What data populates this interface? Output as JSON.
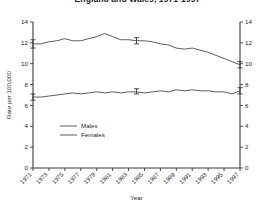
{
  "chart_data": {
    "type": "line",
    "title": "England and Wales, 1971-1997",
    "xlabel": "Year",
    "ylabel": "Rate per 100,000",
    "xlim": [
      1971,
      1997
    ],
    "ylim": [
      0,
      14
    ],
    "yticks": [
      0,
      2,
      4,
      6,
      8,
      10,
      12,
      14
    ],
    "dual_y_axis": true,
    "grid": false,
    "legend_position": "center-left",
    "xticks": [
      1971,
      1973,
      1975,
      1977,
      1979,
      1981,
      1983,
      1985,
      1987,
      1989,
      1991,
      1993,
      1995,
      1997
    ],
    "x": [
      1971,
      1972,
      1973,
      1974,
      1975,
      1976,
      1977,
      1978,
      1979,
      1980,
      1981,
      1982,
      1983,
      1984,
      1985,
      1986,
      1987,
      1988,
      1989,
      1990,
      1991,
      1992,
      1993,
      1994,
      1995,
      1996,
      1997
    ],
    "series": [
      {
        "name": "Males",
        "values": [
          11.9,
          11.9,
          12.1,
          12.2,
          12.4,
          12.2,
          12.2,
          12.4,
          12.6,
          12.9,
          12.6,
          12.3,
          12.3,
          12.2,
          12.2,
          12.1,
          11.9,
          11.8,
          11.5,
          11.4,
          11.5,
          11.3,
          11.1,
          10.8,
          10.5,
          10.2,
          9.9
        ],
        "error_bars": [
          {
            "year": 1971,
            "value": 11.9,
            "low": 11.5,
            "high": 12.3
          },
          {
            "year": 1984,
            "value": 12.2,
            "low": 11.9,
            "high": 12.5
          },
          {
            "year": 1997,
            "value": 9.9,
            "low": 9.6,
            "high": 10.2
          }
        ]
      },
      {
        "name": "Females",
        "values": [
          6.8,
          6.8,
          6.9,
          7.0,
          7.1,
          7.2,
          7.1,
          7.2,
          7.3,
          7.2,
          7.3,
          7.2,
          7.3,
          7.3,
          7.2,
          7.3,
          7.4,
          7.3,
          7.5,
          7.4,
          7.5,
          7.4,
          7.4,
          7.3,
          7.3,
          7.1,
          7.4
        ],
        "error_bars": [
          {
            "year": 1971,
            "value": 6.8,
            "low": 6.5,
            "high": 7.1
          },
          {
            "year": 1984,
            "value": 7.3,
            "low": 7.1,
            "high": 7.6
          },
          {
            "year": 1997,
            "value": 7.4,
            "low": 7.1,
            "high": 7.7
          }
        ]
      }
    ],
    "legend": [
      "Males",
      "Females"
    ]
  }
}
